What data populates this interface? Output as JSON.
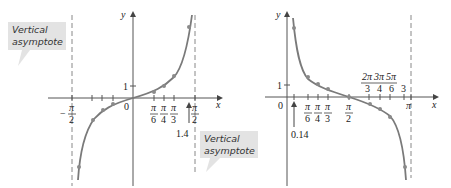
{
  "figure": {
    "left_graph": {
      "function": "tan x",
      "axis_labels": {
        "x": "x",
        "y": "y"
      },
      "origin_label": "0",
      "y_tick_label": "1",
      "x_tick_labels": {
        "neg_pi_over_2": {
          "sign": "−",
          "num": "π",
          "den": "2"
        },
        "pi_over_6": {
          "num": "π",
          "den": "6"
        },
        "pi_over_4": {
          "num": "π",
          "den": "4"
        },
        "pi_over_3": {
          "num": "π",
          "den": "3"
        },
        "pi_over_2": {
          "num": "π",
          "den": "2"
        }
      },
      "marker_label": "1.4",
      "callouts": [
        {
          "line1": "Vertical",
          "line2": "asymptote"
        },
        {
          "line1": "Vertical",
          "line2": "asymptote"
        }
      ],
      "colors": {
        "curve": "#7a7a7a",
        "axis": "#555555",
        "asymptote": "#888888",
        "callout_bg": "#e3e3e3"
      }
    },
    "right_graph": {
      "function": "cot x",
      "axis_labels": {
        "x": "x",
        "y": "y"
      },
      "origin_label": "0",
      "y_tick_label": "1",
      "x_tick_labels": {
        "pi_over_6": {
          "num": "π",
          "den": "6"
        },
        "pi_over_4": {
          "num": "π",
          "den": "4"
        },
        "pi_over_3": {
          "num": "π",
          "den": "3"
        },
        "pi_over_2": {
          "num": "π",
          "den": "2"
        },
        "two_pi_over_3": {
          "num": "2π",
          "den": "3"
        },
        "three_pi_over_4": {
          "num": "3π",
          "den": "4"
        },
        "five_pi_over_6": {
          "num": "5π",
          "den": "6"
        },
        "three": "3",
        "pi": "π"
      },
      "marker_label": "0.14"
    }
  }
}
